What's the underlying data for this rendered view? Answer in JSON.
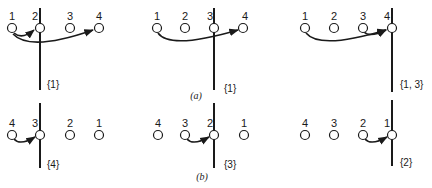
{
  "rows": [
    {
      "caption": "(a)",
      "panels": [
        {
          "labels": [
            "1",
            "2",
            "3",
            "4"
          ],
          "set": "{1}"
        },
        {
          "labels": [
            "1",
            "2",
            "3",
            "4"
          ],
          "set": "{1}"
        },
        {
          "labels": [
            "1",
            "2",
            "3",
            "4"
          ],
          "set": "{1, 3}"
        }
      ]
    },
    {
      "caption": "(b)",
      "panels": [
        {
          "labels": [
            "4",
            "3",
            "2",
            "1"
          ],
          "set": "{4}"
        },
        {
          "labels": [
            "4",
            "3",
            "2",
            "1"
          ],
          "set": "{3}"
        },
        {
          "labels": [
            "4",
            "3",
            "2",
            "1"
          ],
          "set": "{2}"
        }
      ]
    }
  ]
}
